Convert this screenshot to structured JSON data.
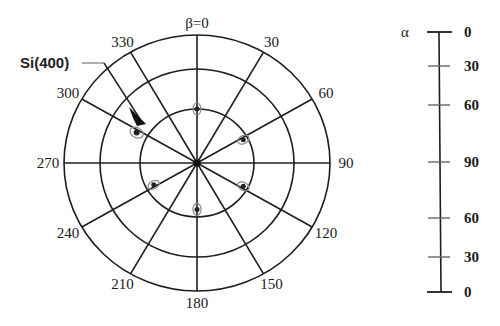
{
  "figure": {
    "type": "pole-figure",
    "title": "",
    "center": {
      "x": 197,
      "y": 163
    },
    "rings": [
      {
        "rx": 57,
        "ry": 54
      },
      {
        "rx": 97,
        "ry": 94
      },
      {
        "rx": 133,
        "ry": 128
      }
    ],
    "beta_label": "β=0",
    "beta_ticks": [
      {
        "angle": 30,
        "label": "30"
      },
      {
        "angle": 60,
        "label": "60"
      },
      {
        "angle": 90,
        "label": "90"
      },
      {
        "angle": 120,
        "label": "120"
      },
      {
        "angle": 150,
        "label": "150"
      },
      {
        "angle": 180,
        "label": "180"
      },
      {
        "angle": 210,
        "label": "210"
      },
      {
        "angle": 240,
        "label": "240"
      },
      {
        "angle": 270,
        "label": "270"
      },
      {
        "angle": 300,
        "label": "300"
      },
      {
        "angle": 330,
        "label": "330"
      }
    ],
    "annotation": {
      "label": "Si(400)",
      "target_beta": 315
    },
    "poles": [
      {
        "beta": 0,
        "ring_fraction": 0.5
      },
      {
        "beta": 62,
        "ring_fraction": 0.46
      },
      {
        "beta": 118,
        "ring_fraction": 0.46
      },
      {
        "beta": 180,
        "ring_fraction": 0.43
      },
      {
        "beta": 242,
        "ring_fraction": 0.43
      },
      {
        "beta": 298,
        "ring_fraction": 0.6,
        "strong": true
      }
    ],
    "alpha_scale": {
      "symbol": "α",
      "ticks": [
        "0",
        "30",
        "60",
        "90",
        "60",
        "30",
        "0"
      ]
    }
  }
}
